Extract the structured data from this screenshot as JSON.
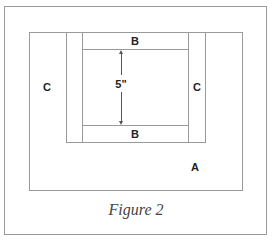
{
  "figure": {
    "caption": "Figure 2",
    "labels": {
      "a": "A",
      "b_top": "B",
      "b_bottom": "B",
      "c_left": "C",
      "c_right": "C",
      "dimension": "5\""
    },
    "colors": {
      "line": "#9a9a9a",
      "text": "#222222"
    }
  }
}
